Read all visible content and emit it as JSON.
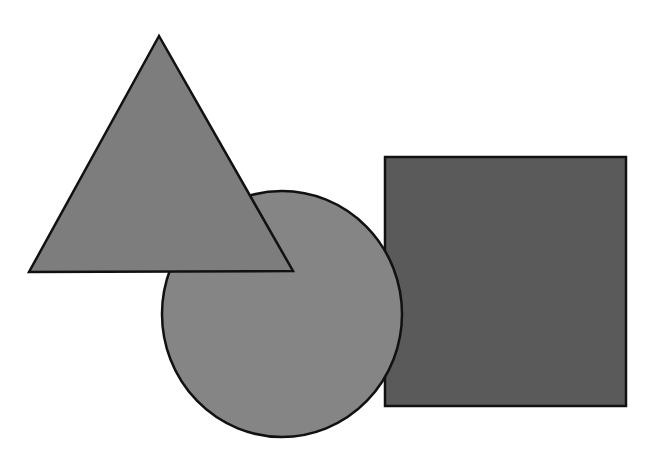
{
  "canvas": {
    "width": 645,
    "height": 458,
    "background": "#ffffff"
  },
  "stroke": {
    "color": "#111111",
    "width": 2.5
  },
  "shapes": {
    "square": {
      "type": "rect",
      "x": 385,
      "y": 157,
      "width": 241,
      "height": 249,
      "fill": "#5a5a5a",
      "z": 1
    },
    "circle": {
      "type": "ellipse",
      "cx": 282,
      "cy": 314,
      "rx": 120,
      "ry": 123,
      "fill": "#858585",
      "z": 2
    },
    "triangle": {
      "type": "polygon",
      "points": "159,36 29,272 293,271",
      "fill": "#7d7d7d",
      "z": 3
    }
  }
}
